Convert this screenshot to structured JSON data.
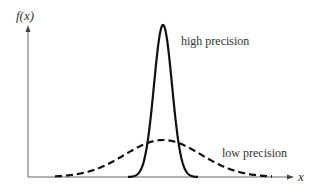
{
  "chart_data": {
    "type": "line",
    "title": "",
    "xlabel": "x",
    "ylabel": "f(x)",
    "grid": false,
    "legend": "inline annotations",
    "series": [
      {
        "name": "high precision",
        "style": "solid",
        "color": "#111111",
        "mean": 0,
        "relative_sd": 1,
        "relative_peak": 1.0
      },
      {
        "name": "low precision",
        "style": "dashed",
        "color": "#111111",
        "mean": 0,
        "relative_sd": 4,
        "relative_peak": 0.25
      }
    ],
    "annotations": [
      "high precision",
      "low precision"
    ]
  },
  "labels": {
    "y_axis": "f(x)",
    "x_axis": "x",
    "high": "high precision",
    "low": "low precision"
  }
}
